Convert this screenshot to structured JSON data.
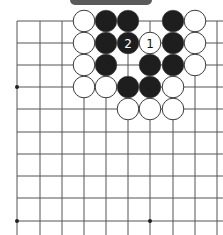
{
  "diagram": {
    "type": "go-board-fragment",
    "grid": {
      "rows": 10,
      "cols": 10,
      "x_positions": [
        17,
        40,
        62,
        84,
        106,
        128,
        150,
        173,
        195,
        217
      ],
      "y_positions": [
        21,
        43,
        65,
        87,
        109,
        132,
        154,
        176,
        198,
        221
      ],
      "line_color": "#555555",
      "open_right": true,
      "open_bottom": true
    },
    "star_points": [
      {
        "col": 0,
        "row": 3
      },
      {
        "col": 0,
        "row": 9
      },
      {
        "col": 6,
        "row": 9
      }
    ],
    "stones": [
      {
        "color": "white",
        "col": 3,
        "row": 0
      },
      {
        "color": "black",
        "col": 4,
        "row": 0
      },
      {
        "color": "black",
        "col": 5,
        "row": 0
      },
      {
        "color": "black",
        "col": 7,
        "row": 0
      },
      {
        "color": "white",
        "col": 8,
        "row": 0
      },
      {
        "color": "white",
        "col": 3,
        "row": 1
      },
      {
        "color": "black",
        "col": 4,
        "row": 1
      },
      {
        "color": "black",
        "col": 5,
        "row": 1,
        "label": "2"
      },
      {
        "color": "white",
        "col": 6,
        "row": 1,
        "label": "1"
      },
      {
        "color": "black",
        "col": 7,
        "row": 1
      },
      {
        "color": "white",
        "col": 8,
        "row": 1
      },
      {
        "color": "white",
        "col": 3,
        "row": 2
      },
      {
        "color": "black",
        "col": 4,
        "row": 2
      },
      {
        "color": "black",
        "col": 6,
        "row": 2
      },
      {
        "color": "black",
        "col": 7,
        "row": 2
      },
      {
        "color": "white",
        "col": 8,
        "row": 2
      },
      {
        "color": "white",
        "col": 3,
        "row": 3
      },
      {
        "color": "white",
        "col": 4,
        "row": 3
      },
      {
        "color": "black",
        "col": 5,
        "row": 3
      },
      {
        "color": "black",
        "col": 6,
        "row": 3
      },
      {
        "color": "white",
        "col": 7,
        "row": 3
      },
      {
        "color": "white",
        "col": 5,
        "row": 4
      },
      {
        "color": "white",
        "col": 6,
        "row": 4
      },
      {
        "color": "white",
        "col": 7,
        "row": 4
      }
    ],
    "colors": {
      "black_stone": "#1e1e1e",
      "white_stone": "#ffffff",
      "stone_outline": "#3a3a3a",
      "label_bar": "#5a5a5a"
    }
  }
}
